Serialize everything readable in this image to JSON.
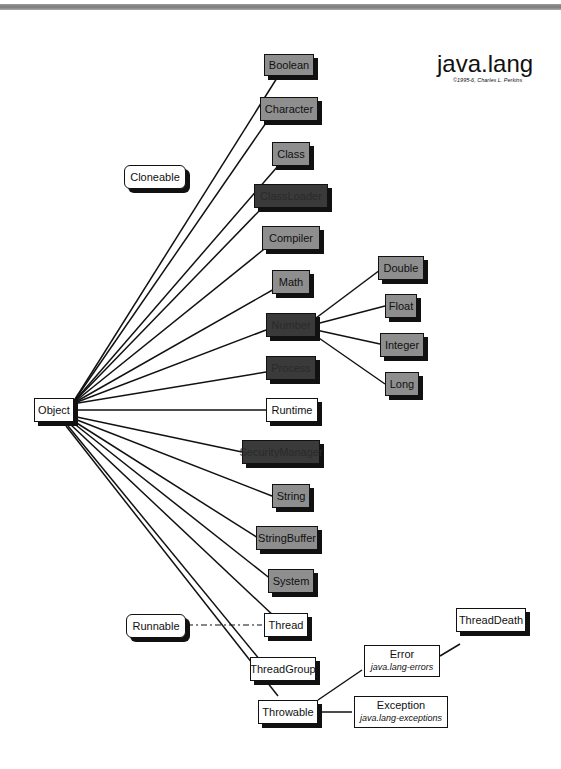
{
  "header": {
    "title": "java.lang",
    "copyright": "©1995-6, Charles L. Perkins"
  },
  "diagram": {
    "root": "Object",
    "interfaces": [
      {
        "label": "Cloneable"
      },
      {
        "label": "Runnable",
        "implemented_by": "Thread",
        "link_style": "dash-dot"
      }
    ],
    "classes": [
      {
        "label": "Boolean",
        "style": "gray"
      },
      {
        "label": "Character",
        "style": "gray"
      },
      {
        "label": "Class",
        "style": "gray"
      },
      {
        "label": "ClassLoader",
        "style": "dark"
      },
      {
        "label": "Compiler",
        "style": "gray"
      },
      {
        "label": "Math",
        "style": "gray"
      },
      {
        "label": "Number",
        "style": "dark"
      },
      {
        "label": "Process",
        "style": "dark"
      },
      {
        "label": "Runtime",
        "style": "white"
      },
      {
        "label": "SecurityManager",
        "style": "dark"
      },
      {
        "label": "String",
        "style": "gray"
      },
      {
        "label": "StringBuffer",
        "style": "gray"
      },
      {
        "label": "System",
        "style": "gray"
      },
      {
        "label": "Thread",
        "style": "white"
      },
      {
        "label": "ThreadGroup",
        "style": "white"
      },
      {
        "label": "Throwable",
        "style": "white"
      }
    ],
    "number_subclasses": [
      "Double",
      "Float",
      "Integer",
      "Long"
    ],
    "throwable_subclasses": [
      {
        "label": "Error",
        "sub": "java.lang-errors"
      },
      {
        "label": "Exception",
        "sub": "java.lang-exceptions"
      }
    ],
    "error_subclasses": [
      "ThreadDeath"
    ]
  }
}
